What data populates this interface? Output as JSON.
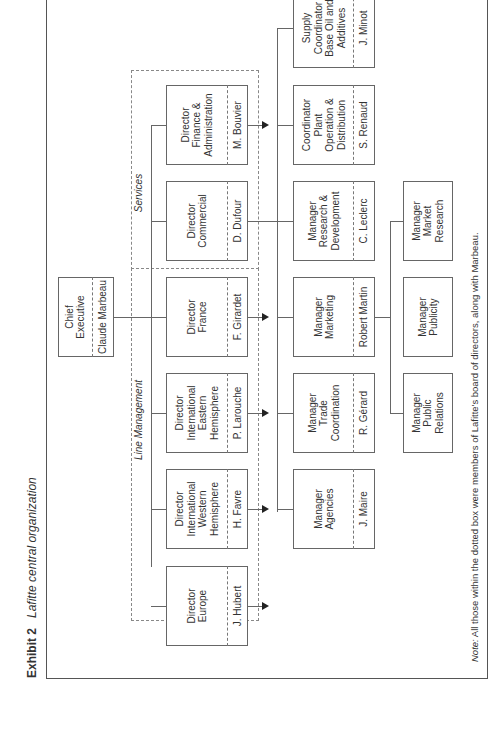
{
  "exhibit": {
    "label": "Exhibit 2",
    "title": "Lafitte central organization"
  },
  "groups": {
    "line_management": "Line Management",
    "services": "Services"
  },
  "chief": {
    "title": "Chief\nExecutive",
    "name": "Claude Marbeau"
  },
  "directors": [
    {
      "title": "Director\nFinance &\nAdministration",
      "name": "M. Bouvier"
    },
    {
      "title": "Director\nCommercial",
      "name": "D. Dufour"
    },
    {
      "title": "Director\nFrance",
      "name": "F. Girardet"
    },
    {
      "title": "Director\nInternational\nEastern\nHemisphere",
      "name": "P. Larouche"
    },
    {
      "title": "Director\nInternational\nWestern\nHemisphere",
      "name": "H. Favre"
    },
    {
      "title": "Director\nEurope",
      "name": "J. Hubert"
    }
  ],
  "managers": [
    {
      "title": "Supply\nCoordinator\nBase Oil and\nAdditives",
      "name": "J. Minot"
    },
    {
      "title": "Coordinator\nPlant\nOperation &\nDistribution",
      "name": "S. Renaud"
    },
    {
      "title": "Manager\nResearch &\nDevelopment",
      "name": "C. Leclerc"
    },
    {
      "title": "Manager\nMarketing",
      "name": "Robert Martin"
    },
    {
      "title": "Manager\nTrade\nCoordination",
      "name": "R. Gérard"
    },
    {
      "title": "Manager\nAgencies",
      "name": "J. Maire"
    }
  ],
  "sub_managers": [
    {
      "title": "Manager\nMarket\nResearch"
    },
    {
      "title": "Manager\nPublicity"
    },
    {
      "title": "Manager\nPublic\nRelations"
    }
  ],
  "note": {
    "label": "Note:",
    "text": " All those within the dotted box were members of Lafitte's board of directors, along with Marbeau."
  }
}
